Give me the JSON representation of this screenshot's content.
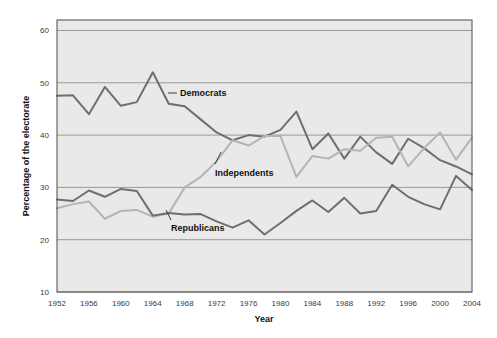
{
  "chart_data": {
    "type": "line",
    "title": "",
    "xlabel": "Year",
    "ylabel": "Percentage of the electorate",
    "xlim": [
      1952,
      2004
    ],
    "ylim": [
      10,
      62
    ],
    "grid": "horizontal",
    "legend_position": "inline-annotations",
    "x_tick_labels": [
      "1952",
      "1956",
      "1960",
      "1964",
      "1968",
      "1972",
      "1976",
      "1980",
      "1984",
      "1988",
      "1992",
      "1996",
      "2000",
      "2004"
    ],
    "x_tick_values": [
      1952,
      1956,
      1960,
      1964,
      1968,
      1972,
      1976,
      1980,
      1984,
      1988,
      1992,
      1996,
      2000,
      2004
    ],
    "y_tick_labels": [
      "10",
      "20",
      "30",
      "40",
      "50",
      "60"
    ],
    "y_tick_values": [
      10,
      20,
      30,
      40,
      50,
      60
    ],
    "x": [
      1952,
      1954,
      1956,
      1958,
      1960,
      1962,
      1964,
      1966,
      1968,
      1970,
      1972,
      1974,
      1976,
      1978,
      1980,
      1982,
      1984,
      1986,
      1988,
      1990,
      1992,
      1994,
      1996,
      1998,
      2000,
      2002,
      2004
    ],
    "series": [
      {
        "name": "Democrats",
        "color": "#6e6e6e",
        "values": [
          47.5,
          47.6,
          44.0,
          49.2,
          45.6,
          46.3,
          52.0,
          46.0,
          45.5,
          43.0,
          40.5,
          39.0,
          40.0,
          39.7,
          41.0,
          44.5,
          37.3,
          40.3,
          35.5,
          39.7,
          36.7,
          34.5,
          39.3,
          37.5,
          35.2,
          34.0,
          32.5
        ]
      },
      {
        "name": "Independents",
        "color": "#b4b4b4",
        "values": [
          26.0,
          26.8,
          27.3,
          24.0,
          25.5,
          25.7,
          24.4,
          25.0,
          30.0,
          32.0,
          35.0,
          39.0,
          38.0,
          39.8,
          39.8,
          32.0,
          36.0,
          35.5,
          37.3,
          37.0,
          39.5,
          39.7,
          34.0,
          37.5,
          40.5,
          35.3,
          39.5
        ]
      },
      {
        "name": "Republicans",
        "color": "#6e6e6e",
        "values": [
          27.7,
          27.4,
          29.4,
          28.2,
          29.7,
          29.3,
          24.6,
          25.1,
          24.8,
          24.9,
          23.5,
          22.3,
          23.7,
          21.0,
          23.2,
          25.5,
          27.5,
          25.3,
          28.0,
          25.0,
          25.5,
          30.5,
          28.2,
          26.8,
          25.8,
          32.2,
          29.5
        ]
      }
    ],
    "annotations": [
      {
        "name": "Democrats",
        "label": "Democrats"
      },
      {
        "name": "Independents",
        "label": "Independents"
      },
      {
        "name": "Republicans",
        "label": "Republicans"
      }
    ]
  },
  "colors": {
    "plot_background": "#e9e9e9",
    "page_background": "#ffffff",
    "gridline": "#8e8e8e",
    "border": "#4a4a4a",
    "dark_series": "#6e6e6e",
    "light_series": "#b4b4b4",
    "text": "#111111"
  }
}
